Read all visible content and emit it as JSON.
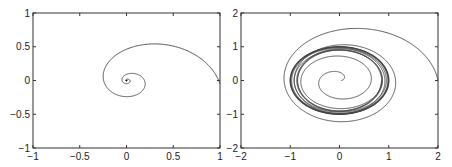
{
  "chart_data": [
    {
      "type": "line",
      "title": "",
      "xlabel": "",
      "ylabel": "",
      "xlim": [
        -1,
        1
      ],
      "ylim": [
        -1,
        1
      ],
      "xticks": [
        -1,
        -0.5,
        0,
        0.5,
        1
      ],
      "xtick_labels": [
        "-1",
        "-0.5",
        "0",
        "0.5",
        "1"
      ],
      "yticks": [
        -1,
        -0.5,
        0,
        0.5,
        1
      ],
      "ytick_labels": [
        "-1",
        "-0.5",
        "0",
        "0.5",
        "1"
      ],
      "grid": false,
      "description": "Phase portrait: single trajectory spiraling inward from (1, 0) to a stable focus at the origin",
      "series": [
        {
          "name": "trajectory",
          "kind": "decaying-spiral",
          "start": [
            1,
            0
          ],
          "end": [
            0,
            0
          ],
          "sample_points": [
            [
              1,
              0.05
            ],
            [
              0.1,
              0.8
            ],
            [
              -0.6,
              0.1
            ],
            [
              -0.05,
              -0.48
            ],
            [
              0.37,
              0.0
            ],
            [
              0.0,
              0.18
            ],
            [
              -0.12,
              0.0
            ],
            [
              0,
              0
            ]
          ]
        }
      ]
    },
    {
      "type": "line",
      "title": "",
      "xlabel": "",
      "ylabel": "",
      "xlim": [
        -2,
        2
      ],
      "ylim": [
        -2,
        2
      ],
      "xticks": [
        -2,
        -1,
        0,
        1,
        2
      ],
      "xtick_labels": [
        "-2",
        "-1",
        "0",
        "1",
        "2"
      ],
      "yticks": [
        -2,
        -1,
        0,
        1,
        2
      ],
      "ytick_labels": [
        "-2",
        "-1",
        "0",
        "1",
        "2"
      ],
      "grid": false,
      "description": "Phase portrait: trajectories from outside (2, 0) and inside (near origin) converging to a stable limit cycle of radius ~1",
      "series": [
        {
          "name": "outer-trajectory",
          "kind": "spiral-to-limit-cycle",
          "start": [
            2,
            0
          ],
          "sample_points": [
            [
              2,
              0.1
            ],
            [
              0.2,
              1.62
            ],
            [
              -1.4,
              0.0
            ],
            [
              -0.1,
              -1.25
            ],
            [
              1.15,
              0.0
            ],
            [
              0.0,
              1.05
            ]
          ]
        },
        {
          "name": "inner-trajectory",
          "kind": "spiral-to-limit-cycle",
          "start": [
            0.05,
            0.0
          ],
          "sample_points": [
            [
              0.05,
              0.0
            ],
            [
              -0.3,
              0.45
            ],
            [
              -0.65,
              0.0
            ],
            [
              0.0,
              -0.75
            ],
            [
              0.85,
              0.0
            ],
            [
              0.0,
              0.95
            ]
          ]
        },
        {
          "name": "limit-cycle",
          "kind": "closed-orbit",
          "center": [
            0,
            0
          ],
          "radius_x": 1.0,
          "radius_y": 1.0
        }
      ]
    }
  ]
}
